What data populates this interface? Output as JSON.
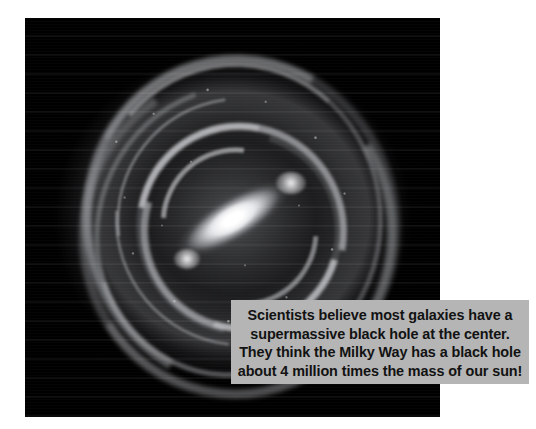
{
  "page": {
    "background_color": "#ffffff",
    "width": 536,
    "height": 429
  },
  "figure": {
    "name": "milky-way-galaxy-illustration",
    "background_color": "#000000",
    "rendering": "grayscale"
  },
  "caption": {
    "background_color": "#b5b5b5",
    "text_color": "#121212",
    "lines": [
      "Scientists believe most galaxies have a",
      "supermassive black hole at the center.",
      "They think the Milky Way has a black hole",
      "about 4 million times the mass of our sun!"
    ],
    "full_text": "Scientists believe most galaxies have a supermassive black hole at the center. They think the Milky Way has a black hole about 4 million times the mass of our sun!",
    "facts": {
      "black_hole_mass_multiple_of_sun": "4 million",
      "galaxy": "Milky Way",
      "object": "supermassive black hole",
      "location": "the center"
    }
  }
}
